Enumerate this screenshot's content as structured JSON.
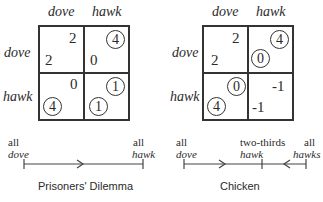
{
  "games": [
    {
      "name": "Prisoners' Dilemma",
      "col_labels": [
        "dove",
        "hawk"
      ],
      "row_labels": [
        "dove",
        "hawk"
      ],
      "cells": [
        [
          {
            "top": "2",
            "top_circled": false,
            "bottom": "2",
            "bottom_circled": false
          },
          {
            "top": "4",
            "top_circled": true,
            "bottom": "0",
            "bottom_circled": false
          }
        ],
        [
          {
            "top": "0",
            "top_circled": false,
            "bottom": "4",
            "bottom_circled": true
          },
          {
            "top": "1",
            "top_circled": true,
            "bottom": "1",
            "bottom_circled": true
          }
        ]
      ],
      "line": {
        "left_label_1": "all",
        "left_label_2": "dove",
        "right_label_1": "all",
        "right_label_2": "hawk"
      }
    },
    {
      "name": "Chicken",
      "col_labels": [
        "dove",
        "hawk"
      ],
      "row_labels": [
        "dove",
        "hawk"
      ],
      "cells": [
        [
          {
            "top": "2",
            "top_circled": false,
            "bottom": "2",
            "bottom_circled": false
          },
          {
            "top": "4",
            "top_circled": true,
            "bottom": "0",
            "bottom_circled": true
          }
        ],
        [
          {
            "top": "0",
            "top_circled": true,
            "bottom": "4",
            "bottom_circled": true
          },
          {
            "top": "-1",
            "top_circled": false,
            "bottom": "-1",
            "bottom_circled": false
          }
        ]
      ],
      "line": {
        "left_label_1": "all",
        "left_label_2": "dove",
        "mid_label_1": "two-thirds",
        "mid_label_2": "hawk",
        "right_label_1": "all",
        "right_label_2": "hawks"
      }
    }
  ]
}
